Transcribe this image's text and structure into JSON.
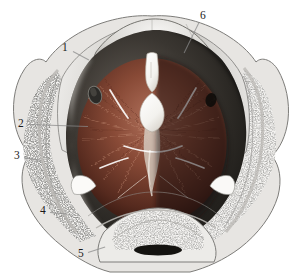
{
  "figure": {
    "background_color": "#ffffff",
    "view": "superior (from above)",
    "labels": [
      {
        "id": "1",
        "text": "1",
        "x": 62,
        "y": 42,
        "leader": {
          "x": 73,
          "y": 51,
          "length": 18,
          "angle": 28
        }
      },
      {
        "id": "2",
        "text": "2",
        "x": 18,
        "y": 118,
        "leader": {
          "x": 28,
          "y": 124,
          "length": 60,
          "angle": 2
        }
      },
      {
        "id": "3",
        "text": "3",
        "x": 14,
        "y": 150,
        "leader": {
          "x": 24,
          "y": 157,
          "length": 16,
          "angle": 10
        }
      },
      {
        "id": "4",
        "text": "4",
        "x": 40,
        "y": 205,
        "leader": {
          "x": 50,
          "y": 212,
          "length": 16,
          "angle": 5
        }
      },
      {
        "id": "5",
        "text": "5",
        "x": 78,
        "y": 248,
        "leader": {
          "x": 88,
          "y": 252,
          "length": 18,
          "angle": -18
        }
      },
      {
        "id": "6",
        "text": "6",
        "x": 200,
        "y": 10,
        "leader": {
          "x": 199,
          "y": 22,
          "length": 34,
          "angle": 116
        }
      }
    ],
    "colors": {
      "bone_cortical_light": "#e9e7e4",
      "bone_cortical_mid": "#cfcdc9",
      "bone_shadow": "#9b9a97",
      "trabecular_speckle": "#3a3a38",
      "trabecular_base": "#f2f1ef",
      "muscle_light": "#a9634d",
      "muscle_mid": "#7c3f2e",
      "muscle_dark": "#4a2218",
      "cavity_shadow": "#2b2926",
      "cavity_deep": "#16150f",
      "viscera_white": "#fbfbf9",
      "outline": "#6f6e6b",
      "label_text": "#1a1a1a",
      "leader_line": "#8a8a8a"
    },
    "regions": [
      {
        "name": "sacral-promontory",
        "description": "curved sacral bone ridge across top"
      },
      {
        "name": "left-ilium-cut",
        "description": "cut iliac bone, left, trabecular interior"
      },
      {
        "name": "right-ilium-cut",
        "description": "cut iliac bone, right, trabecular interior"
      },
      {
        "name": "sacral-foramen",
        "description": "dark oval foramen on left sacral ala"
      },
      {
        "name": "levator-ani-muscle",
        "description": "fan-shaped reddish-brown pelvic floor fibers"
      },
      {
        "name": "urethral-opening",
        "description": "narrow white slit, upper midline"
      },
      {
        "name": "vaginal-opening",
        "description": "rounded white aperture, mid midline"
      },
      {
        "name": "pubic-symphysis",
        "description": "bone block at bottom midline"
      },
      {
        "name": "pelvic-cavity-shadow",
        "description": "dark shadowed right pelvic wall"
      }
    ]
  }
}
